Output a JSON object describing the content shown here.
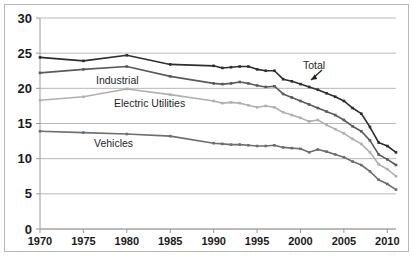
{
  "chart_data": {
    "type": "line",
    "title": "",
    "subtitle": "",
    "xlabel": "",
    "ylabel": "",
    "xlim": [
      1970,
      2011
    ],
    "ylim": [
      0,
      30
    ],
    "ytick_values": [
      0,
      5,
      10,
      15,
      20,
      25,
      30
    ],
    "ytick_labels": [
      "0",
      "5",
      "10",
      "15",
      "20",
      "25",
      "30"
    ],
    "xtick_values": [
      1970,
      1975,
      1980,
      1985,
      1990,
      1995,
      2000,
      2005,
      2010
    ],
    "xtick_labels": [
      "1970",
      "1975",
      "1980",
      "1985",
      "1990",
      "1995",
      "2000",
      "2005",
      "2010"
    ],
    "grid": "horizontal",
    "legend": "none",
    "legend_position": "inline-annotations",
    "markers": "small-square",
    "x": [
      1970,
      1975,
      1980,
      1985,
      1990,
      1991,
      1992,
      1993,
      1994,
      1995,
      1996,
      1997,
      1998,
      1999,
      2000,
      2001,
      2002,
      2003,
      2004,
      2005,
      2006,
      2007,
      2008,
      2009,
      2010,
      2011
    ],
    "series": [
      {
        "name": "Total",
        "color": "#2e2e2e",
        "values": [
          24.4,
          23.9,
          24.7,
          23.4,
          23.2,
          22.9,
          23.0,
          23.1,
          23.1,
          22.7,
          22.5,
          22.5,
          21.3,
          21.0,
          20.6,
          20.2,
          19.8,
          19.3,
          18.8,
          18.2,
          17.2,
          16.4,
          14.5,
          12.3,
          11.8,
          10.9
        ]
      },
      {
        "name": "Industrial",
        "color": "#5a5a5a",
        "values": [
          22.2,
          22.7,
          23.1,
          21.7,
          20.7,
          20.6,
          20.7,
          20.9,
          20.7,
          20.4,
          20.2,
          20.3,
          19.2,
          18.7,
          18.2,
          17.7,
          17.2,
          16.7,
          16.2,
          15.5,
          14.6,
          13.9,
          12.6,
          10.6,
          9.9,
          9.1
        ]
      },
      {
        "name": "Electric Utilities",
        "color": "#b0b0b0",
        "values": [
          18.3,
          18.8,
          19.9,
          19.1,
          18.2,
          17.9,
          18.0,
          17.9,
          17.6,
          17.3,
          17.5,
          17.3,
          16.6,
          16.2,
          15.8,
          15.3,
          15.5,
          14.8,
          14.2,
          13.6,
          12.8,
          12.1,
          10.9,
          9.2,
          8.5,
          7.5
        ]
      },
      {
        "name": "Vehicles",
        "color": "#6e6e6e",
        "values": [
          13.9,
          13.7,
          13.5,
          13.2,
          12.2,
          12.1,
          12.0,
          12.0,
          11.9,
          11.8,
          11.8,
          11.9,
          11.6,
          11.5,
          11.4,
          10.9,
          11.3,
          11.0,
          10.6,
          10.2,
          9.6,
          9.1,
          8.2,
          7.0,
          6.4,
          5.6
        ]
      }
    ],
    "annotations": [
      {
        "text": "Total",
        "series": "Total",
        "x": 2001,
        "kind": "label-with-arrow",
        "arrow": "down-left"
      },
      {
        "text": "Industrial",
        "series": "Industrial",
        "x": 1981,
        "kind": "label"
      },
      {
        "text": "Electric Utilities",
        "series": "Electric Utilities",
        "x": 1985,
        "kind": "label"
      },
      {
        "text": "Vehicles",
        "series": "Vehicles",
        "x": 1980,
        "kind": "label"
      }
    ]
  },
  "labels": {
    "total": "Total",
    "industrial": "Industrial",
    "electric_utilities": "Electric Utilities",
    "vehicles": "Vehicles"
  },
  "colors": {
    "total": "#2e2e2e",
    "industrial": "#5a5a5a",
    "electric_utilities": "#b0b0b0",
    "vehicles": "#6e6e6e",
    "gridline": "#b9b9b9",
    "axis": "#9a9a9a",
    "frame": "#b9b9b9",
    "text": "#1a1a1a",
    "background": "#ffffff"
  }
}
